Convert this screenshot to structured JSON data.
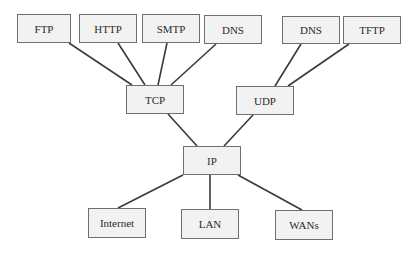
{
  "diagram": {
    "type": "protocol-hierarchy",
    "nodes": [
      {
        "id": "ftp",
        "label": "FTP",
        "x": 17,
        "y": 14,
        "w": 54,
        "h": 29
      },
      {
        "id": "http",
        "label": "HTTP",
        "x": 79,
        "y": 14,
        "w": 58,
        "h": 29
      },
      {
        "id": "smtp",
        "label": "SMTP",
        "x": 142,
        "y": 14,
        "w": 58,
        "h": 29
      },
      {
        "id": "dns1",
        "label": "DNS",
        "x": 204,
        "y": 15,
        "w": 58,
        "h": 29
      },
      {
        "id": "dns2",
        "label": "DNS",
        "x": 282,
        "y": 16,
        "w": 58,
        "h": 28
      },
      {
        "id": "tftp",
        "label": "TFTP",
        "x": 343,
        "y": 16,
        "w": 58,
        "h": 28
      },
      {
        "id": "tcp",
        "label": "TCP",
        "x": 126,
        "y": 85,
        "w": 58,
        "h": 29
      },
      {
        "id": "udp",
        "label": "UDP",
        "x": 236,
        "y": 86,
        "w": 58,
        "h": 29
      },
      {
        "id": "ip",
        "label": "IP",
        "x": 183,
        "y": 146,
        "w": 58,
        "h": 29
      },
      {
        "id": "internet",
        "label": "Internet",
        "x": 88,
        "y": 208,
        "w": 58,
        "h": 30
      },
      {
        "id": "lan",
        "label": "LAN",
        "x": 181,
        "y": 209,
        "w": 58,
        "h": 30
      },
      {
        "id": "wans",
        "label": "WANs",
        "x": 275,
        "y": 210,
        "w": 58,
        "h": 30
      }
    ],
    "edges": [
      {
        "from": "ftp",
        "to": "tcp",
        "x1": 69,
        "y1": 43,
        "x2": 132,
        "y2": 85
      },
      {
        "from": "http",
        "to": "tcp",
        "x1": 118,
        "y1": 43,
        "x2": 145,
        "y2": 85
      },
      {
        "from": "smtp",
        "to": "tcp",
        "x1": 167,
        "y1": 43,
        "x2": 158,
        "y2": 85
      },
      {
        "from": "dns1",
        "to": "tcp",
        "x1": 216,
        "y1": 44,
        "x2": 171,
        "y2": 85
      },
      {
        "from": "dns2",
        "to": "udp",
        "x1": 301,
        "y1": 44,
        "x2": 275,
        "y2": 86
      },
      {
        "from": "tftp",
        "to": "udp",
        "x1": 349,
        "y1": 44,
        "x2": 288,
        "y2": 86
      },
      {
        "from": "tcp",
        "to": "ip",
        "x1": 168,
        "y1": 114,
        "x2": 197,
        "y2": 146
      },
      {
        "from": "udp",
        "to": "ip",
        "x1": 253,
        "y1": 115,
        "x2": 224,
        "y2": 146
      },
      {
        "from": "ip",
        "to": "internet",
        "x1": 183,
        "y1": 175,
        "x2": 118,
        "y2": 208
      },
      {
        "from": "ip",
        "to": "lan",
        "x1": 210,
        "y1": 175,
        "x2": 210,
        "y2": 209
      },
      {
        "from": "ip",
        "to": "wans",
        "x1": 238,
        "y1": 175,
        "x2": 302,
        "y2": 210
      }
    ]
  },
  "colors": {
    "line": "#3a3a3a",
    "box_fill": "#f2f2f2",
    "box_border": "#6f6f6f",
    "text": "#2a2a2a"
  }
}
